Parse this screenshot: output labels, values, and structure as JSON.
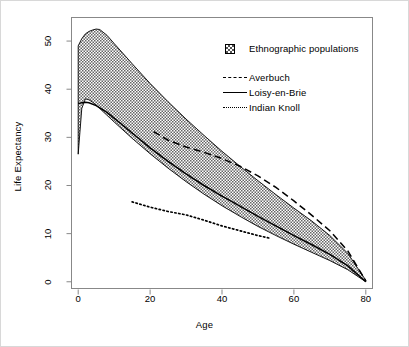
{
  "figure": {
    "background": "#ffffff",
    "border_color": "#d8d8d8",
    "line_color": "#000000",
    "band_fill": "#555555"
  },
  "axes": {
    "x_title": "Age",
    "y_title": "Life Expectancy",
    "x_ticks": [
      0,
      20,
      40,
      60,
      80
    ],
    "y_ticks": [
      0,
      10,
      20,
      30,
      40,
      50
    ],
    "xlim": [
      -2,
      82
    ],
    "ylim": [
      -1.5,
      55
    ]
  },
  "legend": {
    "band_label": "Ethnographic populations",
    "band_key": "hatched-square-swatch",
    "entries": [
      {
        "label": "Averbuch",
        "key": "dashed-line-key"
      },
      {
        "label": "Loisy-en-Brie",
        "key": "solid-line-key"
      },
      {
        "label": "Indian Knoll",
        "key": "dotted-line-key"
      }
    ]
  },
  "chart_data": {
    "type": "line",
    "title": "",
    "xlabel": "Age",
    "ylabel": "Life Expectancy",
    "xlim": [
      -2,
      82
    ],
    "ylim": [
      -1.5,
      55
    ],
    "grid": false,
    "legend_position": "top-right",
    "x": [
      0,
      1,
      2,
      3,
      4,
      5,
      6,
      8,
      10,
      15,
      20,
      25,
      30,
      35,
      40,
      45,
      50,
      55,
      60,
      65,
      70,
      75,
      80
    ],
    "band": {
      "name": "Ethnographic populations",
      "style": "hatched-band",
      "upper": [
        49.0,
        50.5,
        51.5,
        52.0,
        52.3,
        52.5,
        52.4,
        51.2,
        49.5,
        45.3,
        41.2,
        37.4,
        33.8,
        30.4,
        27.1,
        24.0,
        21.0,
        18.1,
        15.3,
        12.6,
        9.6,
        5.9,
        0.3
      ],
      "lower": [
        26.5,
        36.0,
        38.0,
        37.8,
        37.3,
        36.7,
        36.0,
        34.6,
        33.2,
        29.8,
        26.6,
        23.6,
        20.8,
        18.2,
        15.8,
        13.6,
        11.5,
        9.6,
        7.8,
        6.1,
        4.4,
        2.5,
        0.0
      ]
    },
    "series": [
      {
        "name": "Averbuch",
        "style": "dashed",
        "x": [
          21,
          25,
          30,
          35,
          40,
          45,
          50,
          55,
          60,
          65,
          70,
          75,
          80
        ],
        "values": [
          31.2,
          29.4,
          28.0,
          26.9,
          25.6,
          24.0,
          22.0,
          19.6,
          16.8,
          13.8,
          10.6,
          6.4,
          0.2
        ]
      },
      {
        "name": "Loisy-en-Brie",
        "style": "solid",
        "x": [
          0,
          1,
          2,
          3,
          5,
          8,
          10,
          15,
          20,
          25,
          30,
          35,
          40,
          45,
          50,
          55,
          60,
          65,
          70,
          75,
          80
        ],
        "values": [
          37.0,
          37.2,
          37.3,
          37.2,
          36.6,
          35.2,
          34.0,
          30.9,
          27.8,
          25.0,
          22.4,
          20.0,
          17.8,
          15.7,
          13.6,
          11.6,
          9.6,
          7.7,
          5.7,
          3.3,
          0.0
        ]
      },
      {
        "name": "Indian Knoll",
        "style": "dotted",
        "x": [
          15,
          20,
          25,
          30,
          35,
          40,
          45,
          50,
          53
        ],
        "values": [
          16.6,
          15.5,
          14.6,
          13.9,
          12.8,
          11.6,
          10.6,
          9.6,
          9.1
        ]
      }
    ]
  }
}
